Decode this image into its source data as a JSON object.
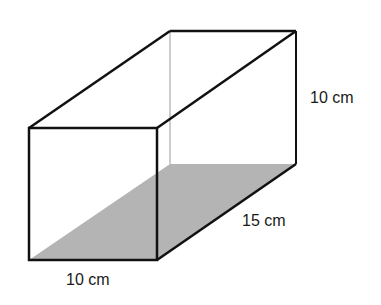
{
  "diagram": {
    "type": "rectangular-prism",
    "labels": {
      "height": "10 cm",
      "depth": "15 cm",
      "width": "10 cm"
    },
    "colors": {
      "edge": "#111111",
      "hidden_edge": "#9a9a9a",
      "base_shade": "#b4b4b4"
    }
  }
}
